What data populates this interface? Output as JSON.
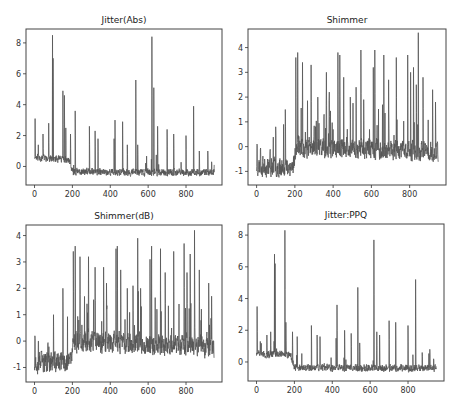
{
  "chart_data": [
    {
      "type": "line",
      "title": "Jitter(Abs)",
      "xlabel": "",
      "ylabel": "",
      "xlim": [
        -45,
        990
      ],
      "ylim": [
        -1.2,
        8.9
      ],
      "xticks": [
        0,
        200,
        400,
        600,
        800
      ],
      "yticks": [
        0,
        2,
        4,
        6,
        8
      ],
      "n_points": 950,
      "baseline_profile": [
        [
          0,
          0.6
        ],
        [
          180,
          0.4
        ],
        [
          200,
          -0.35
        ],
        [
          950,
          -0.4
        ]
      ],
      "noise": 0.35,
      "spikes": [
        [
          3,
          3.1
        ],
        [
          20,
          1.4
        ],
        [
          45,
          2.1
        ],
        [
          75,
          2.8
        ],
        [
          95,
          8.5
        ],
        [
          98,
          7.0
        ],
        [
          150,
          4.9
        ],
        [
          158,
          4.6
        ],
        [
          165,
          2.5
        ],
        [
          190,
          2.1
        ],
        [
          215,
          3.6
        ],
        [
          290,
          2.6
        ],
        [
          320,
          2.3
        ],
        [
          335,
          1.8
        ],
        [
          420,
          1.8
        ],
        [
          425,
          3.0
        ],
        [
          465,
          2.9
        ],
        [
          490,
          1.4
        ],
        [
          535,
          5.6
        ],
        [
          545,
          1.4
        ],
        [
          620,
          8.4
        ],
        [
          630,
          5.1
        ],
        [
          650,
          2.6
        ],
        [
          700,
          2.4
        ],
        [
          735,
          2.1
        ],
        [
          800,
          2.0
        ],
        [
          840,
          3.9
        ],
        [
          870,
          1.0
        ],
        [
          915,
          1.0
        ],
        [
          935,
          0.3
        ]
      ],
      "seed": 11
    },
    {
      "type": "line",
      "title": "Shimmer",
      "xlabel": "",
      "ylabel": "",
      "xlim": [
        -45,
        990
      ],
      "ylim": [
        -1.55,
        4.75
      ],
      "xticks": [
        0,
        200,
        400,
        600,
        800
      ],
      "yticks": [
        -1,
        0,
        1,
        2,
        3,
        4
      ],
      "n_points": 950,
      "baseline_profile": [
        [
          0,
          -0.8
        ],
        [
          190,
          -0.8
        ],
        [
          210,
          0.0
        ],
        [
          950,
          -0.2
        ]
      ],
      "noise": 0.6,
      "spikes": [
        [
          2,
          0.1
        ],
        [
          20,
          -0.1
        ],
        [
          70,
          -0.2
        ],
        [
          100,
          0.8
        ],
        [
          150,
          1.5
        ],
        [
          205,
          3.6
        ],
        [
          215,
          3.8
        ],
        [
          240,
          3.4
        ],
        [
          285,
          3.3
        ],
        [
          320,
          2.0
        ],
        [
          365,
          3.0
        ],
        [
          380,
          2.2
        ],
        [
          425,
          3.8
        ],
        [
          435,
          3.7
        ],
        [
          455,
          2.8
        ],
        [
          490,
          2.0
        ],
        [
          520,
          2.4
        ],
        [
          545,
          3.9
        ],
        [
          560,
          1.9
        ],
        [
          610,
          3.2
        ],
        [
          618,
          3.9
        ],
        [
          665,
          3.7
        ],
        [
          690,
          2.7
        ],
        [
          730,
          3.6
        ],
        [
          790,
          3.7
        ],
        [
          805,
          3.0
        ],
        [
          820,
          3.2
        ],
        [
          835,
          2.5
        ],
        [
          845,
          4.6
        ],
        [
          870,
          2.8
        ],
        [
          920,
          2.3
        ],
        [
          935,
          1.8
        ]
      ],
      "seed": 23
    },
    {
      "type": "line",
      "title": "Shimmer(dB)",
      "xlabel": "",
      "ylabel": "",
      "xlim": [
        -45,
        990
      ],
      "ylim": [
        -1.55,
        4.4
      ],
      "xticks": [
        0,
        200,
        400,
        600,
        800
      ],
      "yticks": [
        -1,
        0,
        1,
        2,
        3,
        4
      ],
      "n_points": 950,
      "baseline_profile": [
        [
          0,
          -0.8
        ],
        [
          190,
          -0.8
        ],
        [
          210,
          0.0
        ],
        [
          950,
          -0.2
        ]
      ],
      "noise": 0.6,
      "spikes": [
        [
          2,
          0.2
        ],
        [
          20,
          0.0
        ],
        [
          70,
          -0.1
        ],
        [
          100,
          1.0
        ],
        [
          150,
          2.0
        ],
        [
          205,
          3.4
        ],
        [
          215,
          3.6
        ],
        [
          240,
          3.2
        ],
        [
          285,
          3.2
        ],
        [
          320,
          2.8
        ],
        [
          365,
          2.8
        ],
        [
          380,
          2.2
        ],
        [
          430,
          3.5
        ],
        [
          437,
          3.6
        ],
        [
          455,
          2.7
        ],
        [
          490,
          2.0
        ],
        [
          520,
          2.1
        ],
        [
          545,
          3.9
        ],
        [
          560,
          2.0
        ],
        [
          610,
          3.1
        ],
        [
          618,
          3.6
        ],
        [
          665,
          3.5
        ],
        [
          690,
          2.6
        ],
        [
          735,
          3.4
        ],
        [
          790,
          3.7
        ],
        [
          805,
          2.6
        ],
        [
          822,
          3.3
        ],
        [
          845,
          4.2
        ],
        [
          870,
          2.7
        ],
        [
          920,
          2.2
        ],
        [
          935,
          1.7
        ]
      ],
      "seed": 37
    },
    {
      "type": "line",
      "title": "Jitter:PPQ",
      "xlabel": "",
      "ylabel": "",
      "xlim": [
        -45,
        990
      ],
      "ylim": [
        -1.2,
        8.7
      ],
      "xticks": [
        0,
        200,
        400,
        600,
        800
      ],
      "yticks": [
        0,
        2,
        4,
        6,
        8
      ],
      "n_points": 950,
      "baseline_profile": [
        [
          0,
          0.5
        ],
        [
          180,
          0.5
        ],
        [
          200,
          -0.35
        ],
        [
          950,
          -0.4
        ]
      ],
      "noise": 0.35,
      "spikes": [
        [
          3,
          3.5
        ],
        [
          20,
          1.3
        ],
        [
          55,
          1.7
        ],
        [
          75,
          1.9
        ],
        [
          95,
          6.8
        ],
        [
          98,
          6.2
        ],
        [
          150,
          8.3
        ],
        [
          155,
          2.5
        ],
        [
          190,
          1.9
        ],
        [
          215,
          1.6
        ],
        [
          290,
          2.3
        ],
        [
          320,
          1.7
        ],
        [
          335,
          1.6
        ],
        [
          420,
          1.5
        ],
        [
          425,
          3.6
        ],
        [
          465,
          2.0
        ],
        [
          500,
          1.8
        ],
        [
          535,
          4.7
        ],
        [
          545,
          1.2
        ],
        [
          620,
          7.7
        ],
        [
          635,
          1.9
        ],
        [
          650,
          1.7
        ],
        [
          700,
          2.6
        ],
        [
          735,
          2.5
        ],
        [
          800,
          2.3
        ],
        [
          840,
          5.2
        ],
        [
          875,
          0.6
        ],
        [
          915,
          0.8
        ],
        [
          935,
          0.2
        ]
      ],
      "seed": 51
    }
  ],
  "layout": {
    "panels": [
      {
        "left": 26,
        "top": 29,
        "width": 196,
        "height": 156,
        "title_y": 15
      },
      {
        "left": 248,
        "top": 29,
        "width": 198,
        "height": 156,
        "title_y": 15
      },
      {
        "left": 26,
        "top": 225,
        "width": 196,
        "height": 157,
        "title_y": 211
      },
      {
        "left": 248,
        "top": 224,
        "width": 196,
        "height": 157,
        "title_y": 210
      }
    ],
    "line_color": "#555555",
    "frame_color": "#444444"
  }
}
